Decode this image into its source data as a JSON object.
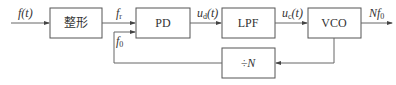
{
  "blocks": {
    "shaper": "整形",
    "pd": "PD",
    "lpf": "LPF",
    "vco": "VCO",
    "divider": "÷N"
  },
  "signals": {
    "input": "f(t)",
    "fr": "f",
    "fr_sub": "r",
    "f0": "f",
    "f0_sub": "0",
    "ud": "u",
    "ud_sub": "d",
    "ud_arg": "(t)",
    "uc": "u",
    "uc_sub": "c",
    "uc_arg": "(t)",
    "output": "Nf",
    "output_sub": "0"
  }
}
